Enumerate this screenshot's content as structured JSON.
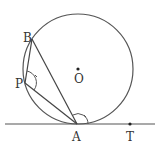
{
  "diagram": {
    "type": "geometry",
    "colors": {
      "stroke": "#555555",
      "text": "#333333",
      "background": "#ffffff"
    },
    "points": {
      "O": {
        "label": "O",
        "x": 78,
        "y": 69
      },
      "A": {
        "label": "A",
        "x": 77,
        "y": 124
      },
      "B": {
        "label": "B",
        "x": 32,
        "y": 39
      },
      "P": {
        "label": "P",
        "x": 25,
        "y": 83
      },
      "T": {
        "label": "T",
        "x": 130,
        "y": 124
      }
    },
    "circle": {
      "center": "O",
      "radius": 55
    },
    "tangent_line": {
      "through": [
        "A",
        "T"
      ]
    },
    "segments": [
      [
        "B",
        "A"
      ],
      [
        "B",
        "P"
      ],
      [
        "P",
        "A"
      ]
    ],
    "angle_marks": [
      {
        "vertex": "P",
        "between": [
          "B",
          "A"
        ]
      },
      {
        "vertex": "A",
        "between": [
          "B",
          "T"
        ]
      }
    ]
  }
}
